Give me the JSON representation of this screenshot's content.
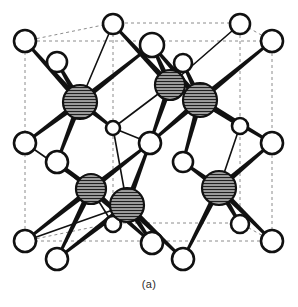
{
  "figure": {
    "caption": "(a)",
    "background_color": "#ffffff"
  },
  "style": {
    "cell_edge_color": "#8c8c8c",
    "cell_edge_dash": "3,3",
    "cell_edge_width": 1,
    "bond_color": "#111111",
    "bond_thick_width": 6,
    "bond_thin_width": 1.6,
    "open_atom_fill": "#ffffff",
    "open_atom_stroke": "#111111",
    "open_atom_stroke_width": 2.6,
    "shaded_atom_fill": "#9a9a9a",
    "shaded_atom_stroke": "#111111",
    "shaded_atom_stroke_width": 2.2,
    "hatch_line_color": "#1a1a1a"
  },
  "legend": {
    "open_atom_name": "open-sphere-atom",
    "shaded_atom_name": "hatched-sphere-atom"
  },
  "chart_data": {
    "type": "scatter",
    "xlabel": "",
    "ylabel": "",
    "projection": "oblique cube, dashed cell edges",
    "cell_corners": [
      {
        "id": "front-top-left",
        "x": 25,
        "y": 41
      },
      {
        "id": "front-top-right",
        "x": 272,
        "y": 41
      },
      {
        "id": "front-bottom-left",
        "x": 25,
        "y": 241
      },
      {
        "id": "front-bottom-right",
        "x": 272,
        "y": 241
      },
      {
        "id": "back-top-left",
        "x": 113,
        "y": 23
      },
      {
        "id": "back-top-right",
        "x": 240,
        "y": 23
      },
      {
        "id": "back-bottom-left",
        "x": 113,
        "y": 223
      },
      {
        "id": "back-bottom-right",
        "x": 240,
        "y": 223
      }
    ],
    "cell_edges": [
      [
        "front-top-left",
        "front-top-right"
      ],
      [
        "front-top-right",
        "front-bottom-right"
      ],
      [
        "front-bottom-right",
        "front-bottom-left"
      ],
      [
        "front-bottom-left",
        "front-top-left"
      ],
      [
        "back-top-left",
        "back-top-right"
      ],
      [
        "back-top-right",
        "back-bottom-right"
      ],
      [
        "back-bottom-right",
        "back-bottom-left"
      ],
      [
        "back-bottom-left",
        "back-top-left"
      ],
      [
        "front-top-left",
        "back-top-left"
      ],
      [
        "front-top-right",
        "back-top-right"
      ],
      [
        "front-bottom-left",
        "back-bottom-left"
      ],
      [
        "front-bottom-right",
        "back-bottom-right"
      ]
    ],
    "atoms_open": [
      {
        "id": "O1",
        "x": 25,
        "y": 41,
        "r": 11,
        "label": "corner front-top-left"
      },
      {
        "id": "O2",
        "x": 272,
        "y": 41,
        "r": 11,
        "label": "corner front-top-right"
      },
      {
        "id": "O3",
        "x": 25,
        "y": 241,
        "r": 11,
        "label": "corner front-bottom-left"
      },
      {
        "id": "O4",
        "x": 272,
        "y": 241,
        "r": 11,
        "label": "corner front-bottom-right"
      },
      {
        "id": "O5",
        "x": 113,
        "y": 24,
        "r": 10,
        "label": "corner back-top-left"
      },
      {
        "id": "O6",
        "x": 240,
        "y": 24,
        "r": 10,
        "label": "corner back-top-right"
      },
      {
        "id": "O7",
        "x": 57,
        "y": 62,
        "r": 10,
        "label": "face-center top-left"
      },
      {
        "id": "O8",
        "x": 152,
        "y": 45,
        "r": 12,
        "label": "face-center top-mid"
      },
      {
        "id": "O9",
        "x": 183,
        "y": 63,
        "r": 9,
        "label": "face-center top-right"
      },
      {
        "id": "O10",
        "x": 25,
        "y": 143,
        "r": 11,
        "label": "edge-center left-front"
      },
      {
        "id": "O11",
        "x": 272,
        "y": 143,
        "r": 11,
        "label": "edge-center right-front"
      },
      {
        "id": "O12",
        "x": 57,
        "y": 162,
        "r": 11,
        "label": "edge-center left-back"
      },
      {
        "id": "O13",
        "x": 240,
        "y": 126,
        "r": 8,
        "label": "edge-center right-back"
      },
      {
        "id": "O14",
        "x": 113,
        "y": 128,
        "r": 7,
        "label": "interior upper-left small"
      },
      {
        "id": "O15",
        "x": 150,
        "y": 143,
        "r": 11,
        "label": "body-center"
      },
      {
        "id": "O16",
        "x": 183,
        "y": 162,
        "r": 10,
        "label": "interior lower-right"
      },
      {
        "id": "O17",
        "x": 57,
        "y": 259,
        "r": 11,
        "label": "bottom face front-left"
      },
      {
        "id": "O18",
        "x": 113,
        "y": 224,
        "r": 8,
        "label": "bottom face back-left"
      },
      {
        "id": "O19",
        "x": 152,
        "y": 243,
        "r": 11,
        "label": "bottom face mid"
      },
      {
        "id": "O20",
        "x": 183,
        "y": 259,
        "r": 11,
        "label": "bottom face front-right"
      },
      {
        "id": "O21",
        "x": 240,
        "y": 224,
        "r": 9,
        "label": "bottom face back-right"
      }
    ],
    "atoms_shaded": [
      {
        "id": "S1",
        "x": 80,
        "y": 102,
        "r": 17,
        "label": "tetrahedral site upper-left"
      },
      {
        "id": "S2",
        "x": 170,
        "y": 85,
        "r": 15,
        "label": "tetrahedral site upper-mid"
      },
      {
        "id": "S3",
        "x": 200,
        "y": 100,
        "r": 17,
        "label": "tetrahedral site upper-right"
      },
      {
        "id": "S4",
        "x": 91,
        "y": 189,
        "r": 15,
        "label": "tetrahedral site lower-left"
      },
      {
        "id": "S5",
        "x": 127,
        "y": 205,
        "r": 17,
        "label": "tetrahedral site lower-mid"
      },
      {
        "id": "S6",
        "x": 219,
        "y": 188,
        "r": 17,
        "label": "tetrahedral site lower-right"
      }
    ],
    "bonds_thick": [
      [
        "S1",
        "O1"
      ],
      [
        "S1",
        "O7"
      ],
      [
        "S1",
        "O10"
      ],
      [
        "S1",
        "O12"
      ],
      [
        "S1",
        "O8"
      ],
      [
        "S1",
        "O14"
      ],
      [
        "S2",
        "O8"
      ],
      [
        "S2",
        "O5"
      ],
      [
        "S2",
        "O15"
      ],
      [
        "S3",
        "O8"
      ],
      [
        "S3",
        "O2"
      ],
      [
        "S3",
        "O9"
      ],
      [
        "S3",
        "O11"
      ],
      [
        "S3",
        "O15"
      ],
      [
        "S3",
        "O16"
      ],
      [
        "S3",
        "O13"
      ],
      [
        "S4",
        "O12"
      ],
      [
        "S4",
        "O3"
      ],
      [
        "S4",
        "O17"
      ],
      [
        "S4",
        "O15"
      ],
      [
        "S4",
        "O19"
      ],
      [
        "S5",
        "O15"
      ],
      [
        "S5",
        "O19"
      ],
      [
        "S5",
        "O17"
      ],
      [
        "S5",
        "O18"
      ],
      [
        "S5",
        "O20"
      ],
      [
        "S6",
        "O16"
      ],
      [
        "S6",
        "O11"
      ],
      [
        "S6",
        "O4"
      ],
      [
        "S6",
        "O20"
      ],
      [
        "S6",
        "O21"
      ]
    ],
    "bonds_thin": [
      [
        "S2",
        "O6"
      ],
      [
        "S2",
        "O9"
      ],
      [
        "S2",
        "O14"
      ],
      [
        "S1",
        "O5"
      ],
      [
        "O14",
        "O15"
      ],
      [
        "S4",
        "O18"
      ],
      [
        "S4",
        "O10"
      ],
      [
        "S5",
        "O14"
      ],
      [
        "S5",
        "O3"
      ],
      [
        "S6",
        "O13"
      ]
    ]
  }
}
